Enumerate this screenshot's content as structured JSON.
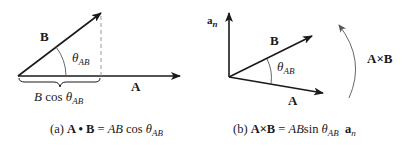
{
  "colors": {
    "stroke": "#1a1a1a",
    "dashed": "#999999",
    "arc": "#666666"
  },
  "panel_a": {
    "vector_a_label": "A",
    "vector_b_label": "B",
    "angle_symbol": "θ",
    "angle_subscript": "AB",
    "projection_prefix": "B",
    "projection_func": " cos ",
    "caption_tag": "(a) ",
    "caption_lhs": "A • B",
    "caption_eq": " = ",
    "caption_rhs_ab": "AB",
    "caption_rhs_func": "cos ",
    "caption_theta": "θ",
    "caption_sub": "AB"
  },
  "panel_b": {
    "normal_label": "a",
    "normal_sub": "n",
    "vector_a_label": "A",
    "vector_b_label": "B",
    "angle_symbol": "θ",
    "angle_subscript": "AB",
    "rotation_label": "A×B",
    "caption_tag": "(b) ",
    "caption_lhs": "A×B",
    "caption_eq": " = ",
    "caption_rhs_ab": "AB",
    "caption_rhs_func": "sin ",
    "caption_theta": "θ",
    "caption_sub": "AB",
    "caption_unit": "a",
    "caption_unit_sub": "n"
  }
}
